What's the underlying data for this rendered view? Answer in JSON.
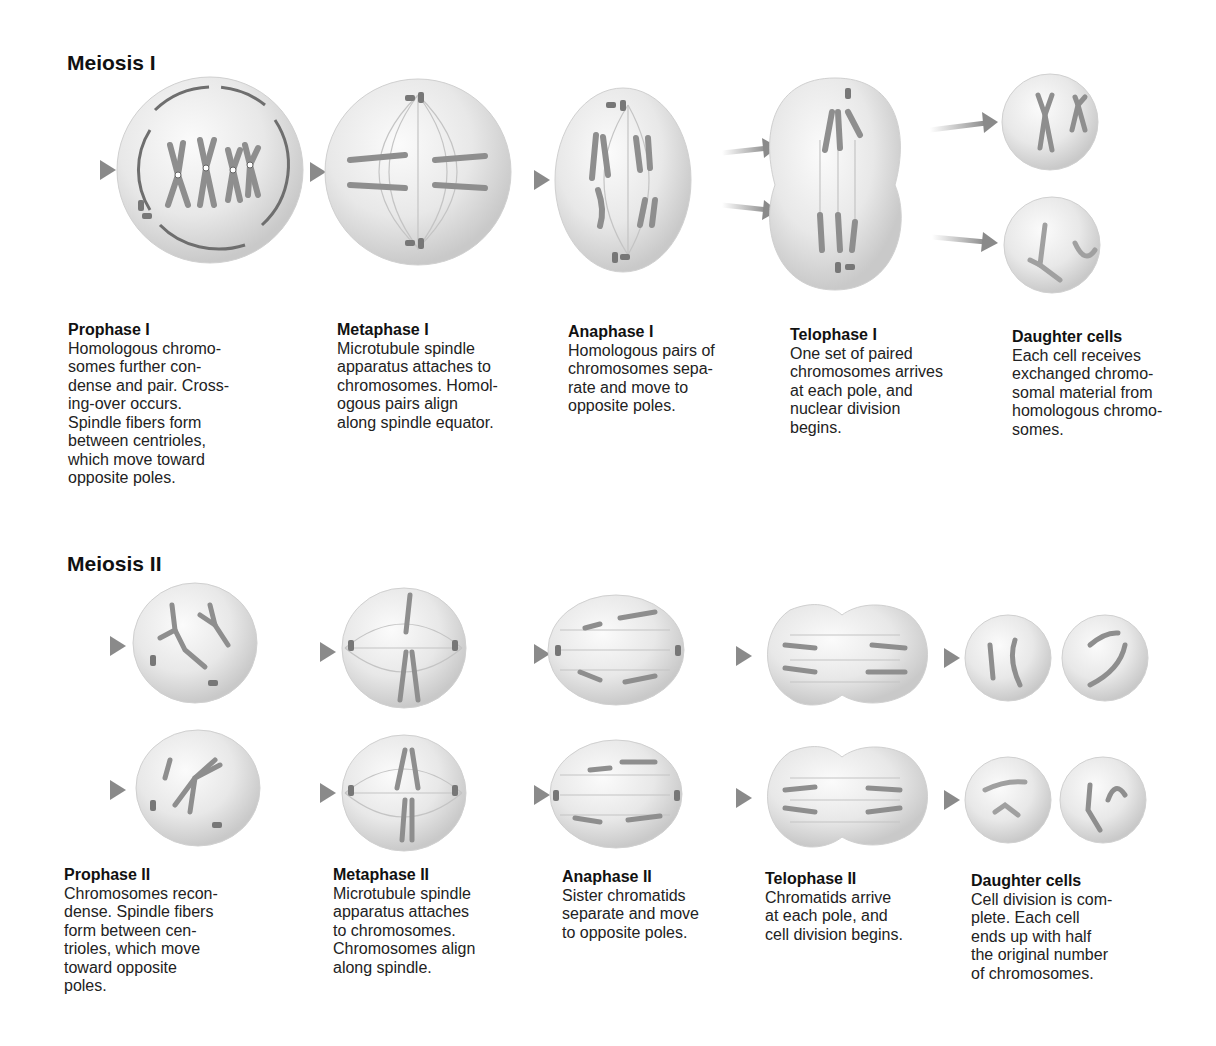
{
  "colors": {
    "background": "#ffffff",
    "cell_fill": "#e9e9e9",
    "cell_shade": "#cfcfcf",
    "chromosome": "#8e8e8e",
    "arrow": "#8a8a8a",
    "text": "#222222"
  },
  "meiosis_1": {
    "title": "Meiosis I",
    "stages": [
      {
        "name": "Prophase I",
        "desc": "Homologous chromo-\nsomes further con-\ndense and pair. Cross-\ning-over occurs.\nSpindle fibers form\nbetween centrioles,\nwhich move toward\nopposite poles."
      },
      {
        "name": "Metaphase I",
        "desc": "Microtubule spindle\napparatus attaches to\nchromosomes. Homol-\nogous pairs align\nalong spindle equator."
      },
      {
        "name": "Anaphase I",
        "desc": "Homologous pairs of\nchromosomes sepa-\nrate and move to\nopposite poles."
      },
      {
        "name": "Telophase I",
        "desc": "One set of paired\nchromosomes arrives\nat each pole, and\nnuclear division\nbegins."
      },
      {
        "name": "Daughter cells",
        "desc": "Each cell receives\nexchanged chromo-\nsomal material from\nhomologous chromo-\nsomes."
      }
    ]
  },
  "meiosis_2": {
    "title": "Meiosis II",
    "stages": [
      {
        "name": "Prophase II",
        "desc": "Chromosomes recon-\ndense. Spindle fibers\nform between cen-\ntrioles, which move\ntoward opposite\npoles."
      },
      {
        "name": "Metaphase II",
        "desc": "Microtubule spindle\napparatus attaches\nto chromosomes.\nChromosomes align\nalong spindle."
      },
      {
        "name": "Anaphase II",
        "desc": "Sister chromatids\nseparate and move\nto opposite poles."
      },
      {
        "name": "Telophase II",
        "desc": "Chromatids arrive\nat each pole, and\ncell division begins."
      },
      {
        "name": "Daughter cells",
        "desc": "Cell division is com-\nplete. Each cell\nends up with half\nthe original number\nof chromosomes."
      }
    ]
  }
}
